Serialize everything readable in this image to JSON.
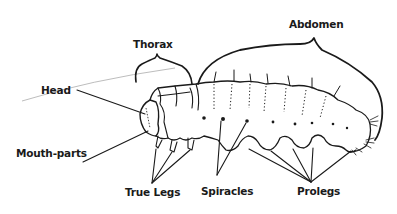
{
  "diagram": {
    "labels": {
      "head": "Head",
      "thorax": "Thorax",
      "abdomen": "Abdomen",
      "mouth_parts": "Mouth-parts",
      "true_legs": "True Legs",
      "spiracles": "Spiracles",
      "prolegs": "Prolegs"
    },
    "colors": {
      "ink": "#1a1a1a",
      "background": "#ffffff",
      "faint_line": "#bbbbbb"
    }
  }
}
